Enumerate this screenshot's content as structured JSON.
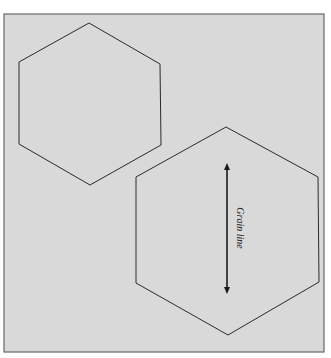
{
  "figure": {
    "background": "#d9d9d9",
    "frame_color": "#555555",
    "line_color": "#2a2a2a",
    "shapes": [
      {
        "name": "small-hexagon",
        "points": "89,23 160,64 161,145 90,185 19,144 19,62"
      },
      {
        "name": "large-hexagon",
        "points": "226,127 318,177 319,282 228,335 136,283 136,177"
      }
    ],
    "grain_line": {
      "label": "Grain line",
      "x": 227,
      "y_top": 163,
      "y_bottom": 294
    }
  }
}
